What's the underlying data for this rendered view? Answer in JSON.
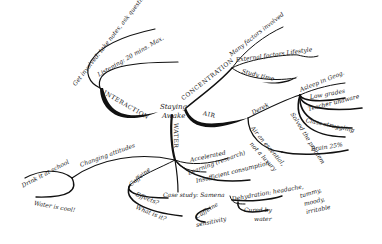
{
  "diagram": {
    "type": "mind_map",
    "central_node": "Staying Awake",
    "branches": [
      {
        "label": "INTERACTION",
        "children": [
          {
            "label": "Listening: 20 mins. Max."
          },
          {
            "label": "Get involved: take notes, ask questions"
          }
        ]
      },
      {
        "label": "CONCENTRATION",
        "children": [
          {
            "label": "Many factors involved"
          },
          {
            "label": "External factors Lifestyle"
          },
          {
            "label": "Study time"
          }
        ]
      },
      {
        "label": "AIR",
        "children": [
          {
            "label": "Derek",
            "children": [
              {
                "label": "Asleep in Geog."
              },
              {
                "label": "Low grades"
              },
              {
                "label": "Teacher unaware"
              },
              {
                "label": "Class struggling"
              },
              {
                "label": "Solved the problem"
              }
            ]
          },
          {
            "label": "Air an essential, not a luxury",
            "children": [
              {
                "label": "Brain 25%"
              }
            ]
          }
        ]
      },
      {
        "label": "WATER",
        "children": [
          {
            "label": "Accelerated Learning (research)"
          },
          {
            "label": "Insufficient consumption"
          },
          {
            "label": "Case study: Samena",
            "children": [
              {
                "label": "Caffeine sensitivity"
              },
              {
                "label": "Dehydration: headache, tummy, moody, irritable"
              },
              {
                "label": "Cured by water"
              }
            ]
          },
          {
            "label": "Caffeine",
            "children": [
              {
                "label": "Effects?"
              },
              {
                "label": "What is it?"
              }
            ]
          },
          {
            "label": "Changing attitudes",
            "children": [
              {
                "label": "Drink it at school"
              },
              {
                "label": "Water is cool!"
              }
            ]
          }
        ]
      }
    ]
  },
  "labels": {
    "staying": "Staying",
    "awake": "Awake",
    "interaction": "INTERACTION",
    "listening": "Listening: 20 mins. Max.",
    "get_involved": "Get involved: take notes, ask questions",
    "concentration": "CONCENTRATION",
    "many_factors": "Many factors involved",
    "external": "External factors Lifestyle",
    "study_time": "Study time",
    "air": "AIR",
    "derek": "Derek",
    "asleep": "Asleep in Geog.",
    "low_grades": "Low grades",
    "teacher": "Teacher unaware",
    "class": "Class struggling",
    "solved": "Solved the problem",
    "air_essential": "Air an essential,",
    "not_luxury": "not a luxury",
    "brain": "Brain 25%",
    "water": "WATER",
    "accelerated": "Accelerated",
    "learning": "Learning (research)",
    "insufficient": "Insufficient consumption",
    "case_study": "Case study: Samena",
    "dehydration": "Dehydration: headache,",
    "tummy": "tummy,",
    "moody": "moody,",
    "irritable": "irritable",
    "cured_by": "Cured by",
    "water_lc": "water",
    "caffeine_s": "Caffeine",
    "sensitivity": "sensitivity",
    "caffeine": "Caffeine",
    "effects": "Effects?",
    "what_is_it": "What is it?",
    "changing": "Changing attitudes",
    "drink": "Drink it at school",
    "water_cool": "Water is cool!"
  },
  "colors": {
    "ink": "#111111",
    "background": "#ffffff"
  }
}
